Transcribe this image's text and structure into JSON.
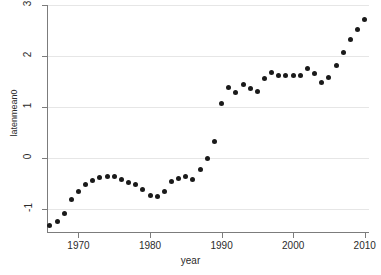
{
  "chart_data": {
    "type": "scatter",
    "title": "",
    "xlabel": "year",
    "ylabel": "latenmean0",
    "xlim": [
      1965.6,
      2010.6
    ],
    "ylim": [
      -1.45,
      3.0
    ],
    "grid": true,
    "legend": null,
    "xticks": [
      1970,
      1980,
      1990,
      2000,
      2010
    ],
    "xtick_labels": [
      "1970",
      "1980",
      "1990",
      "2000",
      "2010"
    ],
    "yticks": [
      -1,
      0,
      1,
      2,
      3
    ],
    "ytick_labels": [
      "-1",
      "0",
      "1",
      "2",
      "3"
    ],
    "marker": "filled-circle",
    "marker_color": "#1a1a1a",
    "grid_color": "#e6e6e6",
    "axis_color": "#7c7c7c",
    "background_color": "#ffffff",
    "x": [
      1966,
      1967,
      1968,
      1969,
      1970,
      1971,
      1972,
      1973,
      1974,
      1975,
      1976,
      1977,
      1978,
      1979,
      1980,
      1981,
      1982,
      1983,
      1984,
      1985,
      1986,
      1987,
      1988,
      1989,
      1990,
      1991,
      1992,
      1993,
      1994,
      1995,
      1996,
      1997,
      1998,
      1999,
      2000,
      2001,
      2002,
      2003,
      2004,
      2005,
      2006,
      2007,
      2008,
      2009,
      2010
    ],
    "y": [
      -1.33,
      -1.25,
      -1.09,
      -0.82,
      -0.65,
      -0.52,
      -0.44,
      -0.38,
      -0.37,
      -0.37,
      -0.42,
      -0.47,
      -0.52,
      -0.61,
      -0.73,
      -0.76,
      -0.65,
      -0.46,
      -0.41,
      -0.37,
      -0.42,
      -0.23,
      0.0,
      0.33,
      1.07,
      1.39,
      1.28,
      1.44,
      1.36,
      1.31,
      1.56,
      1.68,
      1.62,
      1.61,
      1.61,
      1.61,
      1.75,
      1.66,
      1.48,
      1.57,
      1.82,
      2.07,
      2.32,
      2.51,
      2.72
    ]
  },
  "axes": {
    "x_title": "year",
    "y_title": "latenmean0"
  }
}
